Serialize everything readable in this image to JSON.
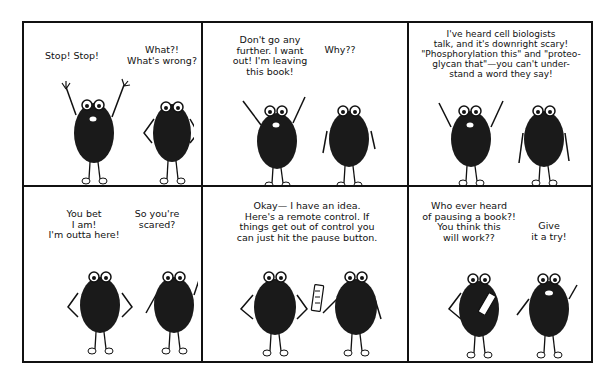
{
  "comic": {
    "panels": [
      {
        "id": 1,
        "left_speech": "Stop! Stop!",
        "right_speech": "What?!\nWhat's wrong?",
        "left_pose": "arms-up",
        "right_pose": "hands-on-hips"
      },
      {
        "id": 2,
        "left_speech": "Don't go any\nfurther. I want\nout! I'm leaving\nthis book!",
        "right_speech": "Why??",
        "left_pose": "arms-up",
        "right_pose": "arms-down"
      },
      {
        "id": 3,
        "top_speech": "I've heard cell biologists\ntalk, and it's downright scary!\n\"Phosphorylation this\" and \"proteo-\nglycan that\"—you can't under-\nstand a word they say!",
        "left_pose": "arms-up",
        "right_pose": "arms-down"
      },
      {
        "id": 4,
        "left_speech": "You bet\nI am!\nI'm outta here!",
        "right_speech": "So you're\nscared?",
        "left_pose": "hands-on-hips",
        "right_pose": "arms-down"
      },
      {
        "id": 5,
        "top_speech": "Okay— I have an idea.\nHere's a remote control. If\nthings get out of control you\ncan just hit the pause button.",
        "left_pose": "hands-on-hips",
        "right_pose": "holding-remote"
      },
      {
        "id": 6,
        "left_speech": "Who ever heard\nof pausing a book?!\nYou think this\nwill work??",
        "right_speech": "Give\nit a try!",
        "left_pose": "holding-remote",
        "right_pose": "arms-down"
      }
    ]
  },
  "colors": {
    "ink": "#111111",
    "paper": "#ffffff"
  }
}
